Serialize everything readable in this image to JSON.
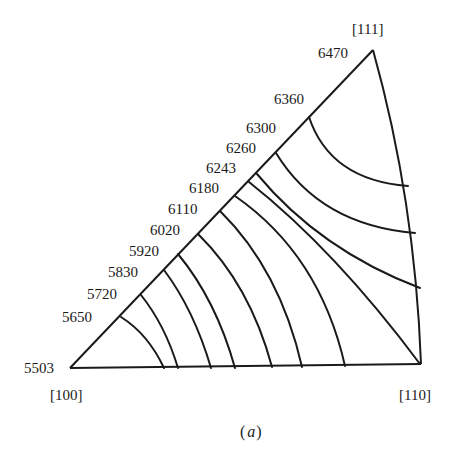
{
  "figure": {
    "caption": "(a)",
    "caption_open": "(",
    "caption_letter": "a",
    "caption_close": ")",
    "type": "stereographic standard triangle contour diagram",
    "line_color": "#1a1a1a",
    "background": "#ffffff"
  },
  "corners": {
    "top": {
      "direction": "[111]",
      "value": "6470"
    },
    "left": {
      "direction": "[100]",
      "value": "5503"
    },
    "right": {
      "direction": "[110]"
    }
  },
  "contour_labels": [
    "5650",
    "5720",
    "5830",
    "5920",
    "6020",
    "6110",
    "6180",
    "6243",
    "6260",
    "6300",
    "6360"
  ],
  "contours": [
    {
      "value": "5650",
      "from": "[100]-[111] edge",
      "to": "[100]-[110] edge"
    },
    {
      "value": "5720",
      "from": "[100]-[111] edge",
      "to": "[100]-[110] edge"
    },
    {
      "value": "5830",
      "from": "[100]-[111] edge",
      "to": "[100]-[110] edge"
    },
    {
      "value": "5920",
      "from": "[100]-[111] edge",
      "to": "[100]-[110] edge"
    },
    {
      "value": "6020",
      "from": "[100]-[111] edge",
      "to": "[100]-[110] edge"
    },
    {
      "value": "6110",
      "from": "[100]-[111] edge",
      "to": "[100]-[110] edge"
    },
    {
      "value": "6180",
      "from": "[100]-[111] edge",
      "to": "[110] corner"
    },
    {
      "value": "6243",
      "from": "[100]-[111] edge",
      "to": "[110]-[111] edge"
    },
    {
      "value": "6260",
      "from": "[100]-[111] edge",
      "to": "[110]-[111] edge"
    },
    {
      "value": "6300",
      "from": "[100]-[111] edge",
      "to": "[110]-[111] edge"
    }
  ]
}
